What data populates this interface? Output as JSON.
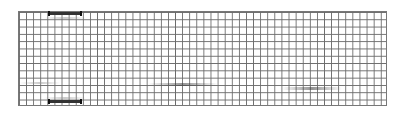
{
  "figure": {
    "type": "grid-diagram",
    "grid": {
      "columns": 52,
      "rows": 13,
      "line_color": "#6a6a6a",
      "background": "#ffffff"
    },
    "markers": [
      {
        "id": "top-bar",
        "position": "top",
        "color": "#333333"
      },
      {
        "id": "bottom-bar",
        "position": "bottom",
        "color": "#333333"
      }
    ],
    "streaks": [
      {
        "id": "streak-1",
        "row_approx": 10
      },
      {
        "id": "streak-2",
        "row_approx": 10
      }
    ]
  }
}
